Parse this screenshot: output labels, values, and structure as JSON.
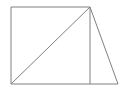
{
  "figure": {
    "title": "",
    "background_color": "#ffffff",
    "stroke_color": "#808080",
    "stroke_width": 1,
    "canvas": {
      "width": 128,
      "height": 94
    },
    "vertices": {
      "top_left": {
        "x": 11,
        "y": 7
      },
      "top_apex": {
        "x": 90,
        "y": 7
      },
      "bottom_left": {
        "x": 11,
        "y": 84
      },
      "bottom_mid": {
        "x": 90,
        "y": 84
      },
      "bottom_right": {
        "x": 118,
        "y": 84
      }
    },
    "segments": [
      {
        "name": "top-edge",
        "x1": 11,
        "y1": 7,
        "x2": 90,
        "y2": 7
      },
      {
        "name": "left-edge",
        "x1": 11,
        "y1": 7,
        "x2": 11,
        "y2": 84
      },
      {
        "name": "bottom-edge",
        "x1": 11,
        "y1": 84,
        "x2": 118,
        "y2": 84
      },
      {
        "name": "diagonal",
        "x1": 11,
        "y1": 84,
        "x2": 90,
        "y2": 7
      },
      {
        "name": "vertical-divider",
        "x1": 90,
        "y1": 7,
        "x2": 90,
        "y2": 84
      },
      {
        "name": "right-slant-edge",
        "x1": 90,
        "y1": 7,
        "x2": 118,
        "y2": 84
      }
    ]
  }
}
